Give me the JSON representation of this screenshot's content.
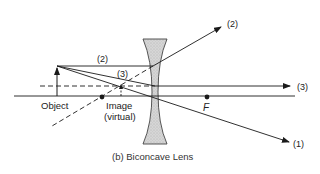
{
  "figure": {
    "caption": "(b) Biconcave Lens",
    "lens_type": "Biconcave",
    "colors": {
      "line": "#1a1a1a",
      "lens_fill": "#cfcfcf",
      "lens_stroke": "#444444",
      "background": "#ffffff"
    }
  },
  "labels": {
    "object": "Object",
    "image_line1": "Image",
    "image_line2": "(virtual)",
    "focal_point": "F",
    "ray1": "(1)",
    "ray2_top": "(2)",
    "ray2_left": "(2)",
    "ray3_right": "(3)",
    "ray3_left": "(3)"
  },
  "elements": {
    "optical_axis": "solid horizontal line",
    "principal_dashed_line": "dashed horizontal line through lens",
    "object_arrow": "upright arrow",
    "image_arrow": "small upright dashed arrow (virtual image)",
    "focal_points": [
      "left focal point dot",
      "right focal point dot F"
    ],
    "rays": [
      {
        "id": "1",
        "description": "ray through lens center, continues undeviated downward to the right"
      },
      {
        "id": "2",
        "description": "ray parallel to axis, diverges upward after lens; dashed extension back to left focal point"
      },
      {
        "id": "3",
        "description": "ray aimed at far focal point, emerges parallel to axis; dashed back-extension"
      }
    ]
  }
}
